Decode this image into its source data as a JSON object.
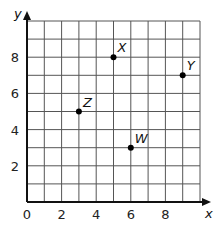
{
  "chart_data": {
    "type": "scatter",
    "title": "",
    "xlabel": "x",
    "ylabel": "y",
    "xlim": [
      0,
      10
    ],
    "ylim": [
      0,
      10
    ],
    "grid": true,
    "x_ticks": [
      0,
      2,
      4,
      6,
      8
    ],
    "y_ticks": [
      2,
      4,
      6,
      8
    ],
    "points": [
      {
        "label": "X",
        "x": 5,
        "y": 8
      },
      {
        "label": "Y",
        "x": 9,
        "y": 7
      },
      {
        "label": "Z",
        "x": 3,
        "y": 5
      },
      {
        "label": "W",
        "x": 6,
        "y": 3
      }
    ]
  },
  "colors": {
    "grid": "#555555",
    "axis": "#111111",
    "point": "#000000"
  }
}
